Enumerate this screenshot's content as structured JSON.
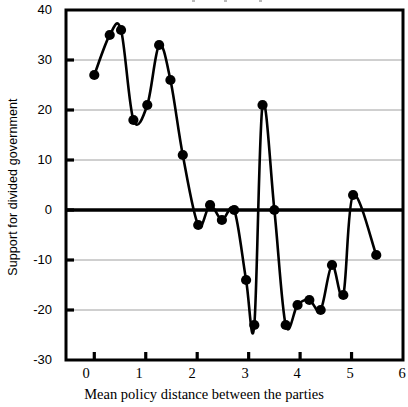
{
  "chart_data": {
    "type": "line",
    "title": "",
    "subtitle": "",
    "xlabel": "Mean policy distance between the parties",
    "ylabel": "Support for divided government",
    "xlim": [
      -0.55,
      6.0
    ],
    "ylim": [
      -30,
      40
    ],
    "xticks": [
      0,
      1,
      2,
      3,
      4,
      5,
      6
    ],
    "xtick_labels": [
      "0",
      "1",
      "2",
      "3",
      "4",
      "5",
      "6"
    ],
    "yticks": [
      40,
      30,
      20,
      10,
      0,
      -10,
      -20,
      -30
    ],
    "ytick_labels": [
      "40",
      "30",
      "20",
      "10",
      "0",
      "-10",
      "-20",
      "-30"
    ],
    "grid": true,
    "grid_axis": "y",
    "grid_color": "#a0a0a0",
    "zero_line": true,
    "zero_line_color": "#000000",
    "legend": false,
    "legend_position": "none",
    "marker": "filled-circle",
    "marker_color": "#000000",
    "line_color": "#000000",
    "line_width": 2.6,
    "series": [
      {
        "name": "Support for divided government",
        "x": [
          0.0,
          0.3,
          0.52,
          0.76,
          1.03,
          1.26,
          1.48,
          1.72,
          2.02,
          2.25,
          2.48,
          2.72,
          2.95,
          3.11,
          3.27,
          3.5,
          3.72,
          3.95,
          4.18,
          4.4,
          4.62,
          4.84,
          5.03,
          5.48
        ],
        "y": [
          27,
          35,
          36,
          18,
          21,
          33,
          26,
          11,
          -3,
          1,
          -2,
          0,
          -14,
          -23,
          21,
          0,
          -23,
          -19,
          -18,
          -20,
          -11,
          -17,
          3,
          -9
        ]
      }
    ],
    "points": [
      {
        "x": 0.0,
        "y": 27
      },
      {
        "x": 0.3,
        "y": 35
      },
      {
        "x": 0.52,
        "y": 36
      },
      {
        "x": 0.76,
        "y": 18
      },
      {
        "x": 1.03,
        "y": 21
      },
      {
        "x": 1.26,
        "y": 33
      },
      {
        "x": 1.48,
        "y": 26
      },
      {
        "x": 1.72,
        "y": 11
      },
      {
        "x": 2.02,
        "y": -3
      },
      {
        "x": 2.25,
        "y": 1
      },
      {
        "x": 2.48,
        "y": -2
      },
      {
        "x": 2.72,
        "y": 0
      },
      {
        "x": 2.95,
        "y": -14
      },
      {
        "x": 3.11,
        "y": -23
      },
      {
        "x": 3.27,
        "y": 21
      },
      {
        "x": 3.5,
        "y": 0
      },
      {
        "x": 3.72,
        "y": -23
      },
      {
        "x": 3.95,
        "y": -19
      },
      {
        "x": 4.18,
        "y": -18
      },
      {
        "x": 4.4,
        "y": -20
      },
      {
        "x": 4.62,
        "y": -11
      },
      {
        "x": 4.84,
        "y": -17
      },
      {
        "x": 5.03,
        "y": 3
      },
      {
        "x": 5.48,
        "y": -9
      }
    ]
  }
}
